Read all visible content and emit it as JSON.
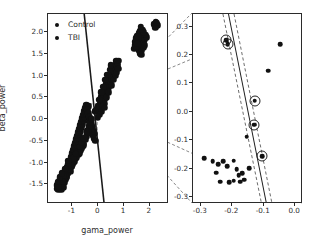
{
  "figure": {
    "title": "",
    "background_color": "#ffffff",
    "marker_color": "#111111",
    "line_color": "#1a1a1a"
  },
  "legend": {
    "entries": [
      {
        "label": "Control",
        "marker": "filled-circle-marker",
        "color": "#111111"
      },
      {
        "label": "TBI",
        "marker": "filled-circle-marker",
        "color": "#111111"
      }
    ]
  },
  "chart_data": [
    {
      "type": "scatter",
      "name": "main-scatter-panel",
      "title": "",
      "xlabel": "gama_power",
      "ylabel": "beta_power",
      "xlim": [
        -1.95,
        2.75
      ],
      "ylim": [
        -1.95,
        2.42
      ],
      "xticks": [
        -1,
        0,
        1,
        2
      ],
      "xticklabels": [
        "-1",
        "0",
        "1",
        "2"
      ],
      "yticks": [
        2.0,
        1.5,
        1.0,
        0.5,
        0.0,
        -0.5,
        -1.0,
        -1.5
      ],
      "yticklabels": [
        "2.0",
        "1.5",
        "1.0",
        "0.5",
        "0.0",
        "-0.5",
        "-1.0",
        "-1.5"
      ],
      "grid": false,
      "legend_position": "upper left",
      "decision_boundary": {
        "style": "solid",
        "x_at_ymax": -0.52,
        "x_at_ymin": 0.26
      },
      "zoom_box": {
        "x0": -0.31,
        "y0": -0.32,
        "x1": -0.01,
        "y1": 0.33,
        "style": "dashed"
      },
      "series": [
        {
          "name": "Control",
          "color": "#111111",
          "points": [
            [
              -1.62,
              -1.6
            ],
            [
              -1.55,
              -1.63
            ],
            [
              -1.48,
              -1.55
            ],
            [
              -1.58,
              -1.5
            ],
            [
              -1.44,
              -1.62
            ],
            [
              -1.5,
              -1.44
            ],
            [
              -1.4,
              -1.48
            ],
            [
              -1.36,
              -1.57
            ],
            [
              -1.3,
              -1.46
            ],
            [
              -1.42,
              -1.36
            ],
            [
              -1.34,
              -1.38
            ],
            [
              -1.26,
              -1.4
            ],
            [
              -1.22,
              -1.31
            ],
            [
              -1.32,
              -1.27
            ],
            [
              -1.18,
              -1.24
            ],
            [
              -1.28,
              -1.19
            ],
            [
              -1.14,
              -1.16
            ],
            [
              -1.22,
              -1.1
            ],
            [
              -1.1,
              -1.08
            ],
            [
              -1.16,
              -1.02
            ],
            [
              -1.05,
              -1.0
            ],
            [
              -1.12,
              -0.95
            ],
            [
              -1.0,
              -0.92
            ],
            [
              -1.07,
              -0.86
            ],
            [
              -0.96,
              -0.84
            ],
            [
              -1.02,
              -0.78
            ],
            [
              -0.92,
              -0.76
            ],
            [
              -0.98,
              -0.7
            ],
            [
              -0.88,
              -0.68
            ],
            [
              -0.94,
              -0.62
            ],
            [
              -0.84,
              -0.6
            ],
            [
              -0.9,
              -0.54
            ],
            [
              -0.8,
              -0.52
            ],
            [
              -0.86,
              -0.46
            ],
            [
              -0.76,
              -0.44
            ],
            [
              -0.82,
              -0.38
            ],
            [
              -0.72,
              -0.36
            ],
            [
              -0.78,
              -0.3
            ],
            [
              -0.68,
              -0.28
            ],
            [
              -0.74,
              -0.22
            ],
            [
              -0.64,
              -0.2
            ],
            [
              -0.7,
              -0.14
            ],
            [
              -0.6,
              -0.12
            ],
            [
              -0.66,
              -0.06
            ],
            [
              -0.56,
              -0.04
            ],
            [
              -0.62,
              0.02
            ],
            [
              -0.52,
              0.04
            ],
            [
              -0.58,
              0.1
            ],
            [
              -0.48,
              0.12
            ],
            [
              -0.54,
              0.18
            ],
            [
              -0.44,
              0.2
            ],
            [
              -0.5,
              0.26
            ],
            [
              -0.4,
              0.28
            ],
            [
              -0.46,
              0.32
            ],
            [
              -0.36,
              0.3
            ],
            [
              -0.42,
              0.22
            ],
            [
              -0.38,
              0.14
            ],
            [
              -0.34,
              0.06
            ],
            [
              -0.3,
              -0.02
            ],
            [
              -0.26,
              -0.1
            ],
            [
              -0.22,
              -0.18
            ],
            [
              -0.18,
              -0.26
            ],
            [
              -0.14,
              -0.34
            ],
            [
              -0.24,
              -0.3
            ],
            [
              -0.28,
              -0.22
            ],
            [
              -0.32,
              -0.14
            ],
            [
              -0.36,
              -0.06
            ],
            [
              -0.2,
              -0.38
            ],
            [
              -0.16,
              -0.44
            ],
            [
              -0.12,
              -0.5
            ],
            [
              -1.46,
              -1.46
            ],
            [
              -1.38,
              -1.52
            ],
            [
              -1.24,
              -1.34
            ],
            [
              -1.08,
              -1.2
            ],
            [
              -0.98,
              -1.04
            ],
            [
              -1.18,
              -1.12
            ],
            [
              -1.3,
              -1.22
            ],
            [
              -1.44,
              -1.4
            ],
            [
              -1.52,
              -1.57
            ],
            [
              -1.6,
              -1.52
            ],
            [
              -1.36,
              -1.44
            ],
            [
              -1.2,
              -1.26
            ],
            [
              -1.04,
              -1.1
            ],
            [
              -0.9,
              -0.98
            ],
            [
              -0.86,
              -0.9
            ],
            [
              -0.78,
              -0.82
            ],
            [
              -0.7,
              -0.72
            ],
            [
              -0.62,
              -0.64
            ],
            [
              -0.56,
              -0.56
            ],
            [
              -0.5,
              -0.48
            ],
            [
              -0.46,
              -0.4
            ],
            [
              -0.42,
              -0.32
            ],
            [
              -0.38,
              -0.24
            ],
            [
              -0.34,
              -0.16
            ],
            [
              -0.3,
              -0.08
            ],
            [
              -0.26,
              0.0
            ],
            [
              -0.58,
              -0.6
            ],
            [
              -0.66,
              -0.68
            ],
            [
              -0.74,
              -0.78
            ],
            [
              -0.82,
              -0.88
            ],
            [
              -0.94,
              -1.0
            ],
            [
              -1.02,
              -1.08
            ],
            [
              -1.1,
              -1.16
            ],
            [
              -1.26,
              -1.3
            ],
            [
              -1.4,
              -1.44
            ],
            [
              -1.54,
              -1.56
            ],
            [
              -1.48,
              -1.38
            ],
            [
              -1.34,
              -1.3
            ],
            [
              -1.14,
              -1.06
            ],
            [
              -0.96,
              -0.9
            ],
            [
              -0.88,
              -0.8
            ],
            [
              -0.72,
              -0.64
            ],
            [
              -0.64,
              -0.54
            ],
            [
              -0.54,
              -0.44
            ],
            [
              -0.44,
              -0.28
            ],
            [
              -1.56,
              -1.44
            ],
            [
              -1.5,
              -1.34
            ],
            [
              -1.42,
              -1.24
            ],
            [
              -1.28,
              -1.14
            ],
            [
              -1.16,
              -0.96
            ]
          ]
        },
        {
          "name": "TBI",
          "color": "#111111",
          "points": [
            [
              -0.12,
              0.18
            ],
            [
              -0.06,
              0.24
            ],
            [
              0.0,
              0.3
            ],
            [
              0.06,
              0.36
            ],
            [
              0.12,
              0.42
            ],
            [
              0.02,
              0.22
            ],
            [
              0.08,
              0.28
            ],
            [
              0.14,
              0.34
            ],
            [
              0.2,
              0.4
            ],
            [
              0.26,
              0.46
            ],
            [
              0.1,
              0.52
            ],
            [
              0.16,
              0.58
            ],
            [
              0.22,
              0.64
            ],
            [
              0.28,
              0.7
            ],
            [
              0.34,
              0.76
            ],
            [
              0.18,
              0.48
            ],
            [
              0.24,
              0.54
            ],
            [
              0.3,
              0.6
            ],
            [
              0.36,
              0.66
            ],
            [
              0.42,
              0.72
            ],
            [
              0.32,
              0.82
            ],
            [
              0.38,
              0.88
            ],
            [
              0.44,
              0.94
            ],
            [
              0.5,
              1.0
            ],
            [
              0.56,
              1.06
            ],
            [
              0.4,
              0.8
            ],
            [
              0.46,
              0.86
            ],
            [
              0.52,
              0.92
            ],
            [
              0.58,
              0.98
            ],
            [
              0.64,
              1.04
            ],
            [
              0.54,
              1.12
            ],
            [
              0.6,
              1.18
            ],
            [
              0.66,
              1.24
            ],
            [
              0.72,
              1.3
            ],
            [
              0.62,
              1.1
            ],
            [
              0.68,
              1.16
            ],
            [
              0.74,
              1.22
            ],
            [
              0.7,
              1.34
            ],
            [
              0.76,
              1.28
            ],
            [
              0.8,
              1.34
            ],
            [
              1.42,
              1.7
            ],
            [
              1.48,
              1.76
            ],
            [
              1.54,
              1.82
            ],
            [
              1.6,
              1.88
            ],
            [
              1.66,
              1.94
            ],
            [
              1.5,
              1.64
            ],
            [
              1.56,
              1.7
            ],
            [
              1.62,
              1.76
            ],
            [
              1.68,
              1.82
            ],
            [
              1.74,
              1.88
            ],
            [
              1.58,
              1.58
            ],
            [
              1.64,
              1.64
            ],
            [
              1.7,
              1.7
            ],
            [
              1.76,
              1.76
            ],
            [
              1.82,
              1.82
            ],
            [
              1.46,
              1.86
            ],
            [
              1.52,
              1.92
            ],
            [
              1.58,
              1.98
            ],
            [
              1.64,
              2.04
            ],
            [
              1.7,
              1.58
            ],
            [
              1.76,
              1.64
            ],
            [
              1.82,
              1.7
            ],
            [
              1.44,
              1.78
            ],
            [
              1.5,
              1.84
            ],
            [
              1.56,
              1.9
            ],
            [
              2.18,
              2.18
            ],
            [
              2.24,
              2.24
            ],
            [
              2.3,
              2.16
            ],
            [
              2.22,
              2.1
            ],
            [
              2.28,
              2.22
            ],
            [
              0.04,
              0.44
            ],
            [
              0.12,
              0.62
            ],
            [
              0.2,
              0.74
            ],
            [
              0.28,
              0.9
            ],
            [
              0.36,
              1.02
            ],
            [
              0.44,
              1.14
            ],
            [
              0.5,
              1.24
            ],
            [
              0.14,
              0.18
            ],
            [
              0.06,
              0.1
            ],
            [
              -0.02,
              0.04
            ],
            [
              0.24,
              0.36
            ],
            [
              0.34,
              0.5
            ],
            [
              0.42,
              0.62
            ],
            [
              0.52,
              0.78
            ],
            [
              0.6,
              0.9
            ],
            [
              0.68,
              1.0
            ],
            [
              0.72,
              1.08
            ],
            [
              0.78,
              1.16
            ],
            [
              0.18,
              0.3
            ],
            [
              0.26,
              0.26
            ],
            [
              1.88,
              1.88
            ],
            [
              1.84,
              1.94
            ],
            [
              1.78,
              2.0
            ],
            [
              1.72,
              2.06
            ],
            [
              1.66,
              2.12
            ],
            [
              1.4,
              1.62
            ],
            [
              1.46,
              1.68
            ],
            [
              1.52,
              1.74
            ],
            [
              1.62,
              1.52
            ],
            [
              1.68,
              1.48
            ]
          ]
        }
      ]
    },
    {
      "type": "scatter",
      "name": "zoom-inset-panel",
      "title": "",
      "xlabel": "",
      "ylabel": "",
      "xlim": [
        -0.325,
        0.025
      ],
      "ylim": [
        -0.325,
        0.345
      ],
      "xticks": [
        -0.3,
        -0.2,
        -0.1,
        0.0
      ],
      "xticklabels": [
        "-0.3",
        "-0.2",
        "-0.1",
        "0.0"
      ],
      "yticks": [
        0.3,
        0.2,
        0.1,
        0.0,
        -0.1,
        -0.2,
        -0.3
      ],
      "yticklabels": [
        "0.3",
        "0.2",
        "0.1",
        "0.0",
        "-0.1",
        "-0.2",
        "-0.3"
      ],
      "grid": false,
      "decision_boundary": {
        "style": "solid",
        "x_at_ytop": -0.21,
        "x_at_ybot": -0.088
      },
      "margins": [
        {
          "style": "dashed",
          "x_at_ytop": -0.228,
          "x_at_ybot": -0.104
        },
        {
          "style": "dashed",
          "x_at_ytop": -0.192,
          "x_at_ybot": -0.07
        }
      ],
      "points": [
        [
          -0.22,
          0.252
        ],
        [
          -0.214,
          0.239
        ],
        [
          -0.129,
          0.039
        ],
        [
          -0.131,
          -0.045
        ],
        [
          -0.105,
          -0.157
        ],
        [
          -0.047,
          0.238
        ],
        [
          -0.085,
          0.145
        ],
        [
          -0.154,
          -0.087
        ],
        [
          -0.147,
          -0.199
        ],
        [
          -0.29,
          -0.163
        ],
        [
          -0.262,
          -0.175
        ],
        [
          -0.252,
          -0.215
        ],
        [
          -0.244,
          -0.185
        ],
        [
          -0.238,
          -0.246
        ],
        [
          -0.228,
          -0.175
        ],
        [
          -0.216,
          -0.192
        ],
        [
          -0.196,
          -0.172
        ],
        [
          -0.186,
          -0.203
        ],
        [
          -0.18,
          -0.223
        ],
        [
          -0.174,
          -0.247
        ],
        [
          -0.168,
          -0.216
        ],
        [
          -0.162,
          -0.24
        ],
        [
          -0.196,
          -0.243
        ],
        [
          -0.21,
          -0.249
        ]
      ],
      "support_vectors": [
        [
          -0.22,
          0.252
        ],
        [
          -0.214,
          0.239
        ],
        [
          -0.129,
          0.039
        ],
        [
          -0.131,
          -0.045
        ],
        [
          -0.105,
          -0.157
        ]
      ]
    }
  ],
  "connectors": {
    "style": "dashed",
    "description": "lines linking zoom box corners in main panel to inset panel corners",
    "count": 4
  }
}
